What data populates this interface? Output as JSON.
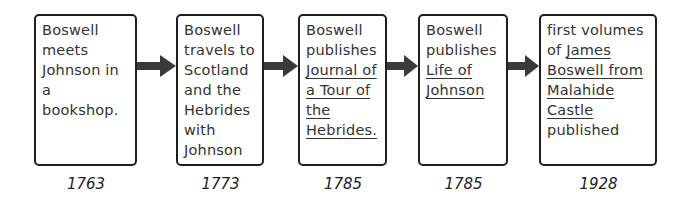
{
  "timeline": {
    "events": [
      {
        "parts": [
          {
            "text": "Boswell meets Johnson in a bookshop.",
            "underline": false
          }
        ],
        "year": "1763"
      },
      {
        "parts": [
          {
            "text": "Boswell travels to Scotland and the Hebrides with Johnson",
            "underline": false
          }
        ],
        "year": "1773"
      },
      {
        "parts": [
          {
            "text": "Boswell publishes ",
            "underline": false
          },
          {
            "text": "Journal of a Tour of the Hebrides.",
            "underline": true
          }
        ],
        "year": "1785"
      },
      {
        "parts": [
          {
            "text": "Boswell publishes ",
            "underline": false
          },
          {
            "text": "Life of Johnson",
            "underline": true
          }
        ],
        "year": "1785"
      },
      {
        "parts": [
          {
            "text": "first volumes of ",
            "underline": false
          },
          {
            "text": "James Boswell from Malahide Castle",
            "underline": true
          },
          {
            "text": " published",
            "underline": false
          }
        ],
        "year": "1928"
      }
    ],
    "colors": {
      "border": "#1e1e1e",
      "arrow": "#3a3a3a",
      "text": "#333333"
    }
  }
}
